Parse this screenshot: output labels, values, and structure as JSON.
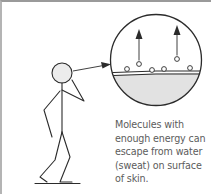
{
  "diagram": {
    "type": "evaporation-illustration",
    "figure": {
      "label": "stick-figure-person",
      "pointer_arrow": "head-to-magnified-view"
    },
    "magnified_view": {
      "label": "skin-surface-closeup",
      "molecule_count": 6,
      "escaping_molecule_count": 2
    },
    "caption_lines": [
      "Molecules with",
      "enough energy can",
      "escape from water",
      "(sweat) on surface",
      "of skin."
    ],
    "colors": {
      "line": "#2b2b2b",
      "skin_fill": "#e2e2e2",
      "head_fill": "#ececec",
      "text": "#5c5c5c",
      "border": "#9a9a9a"
    }
  }
}
